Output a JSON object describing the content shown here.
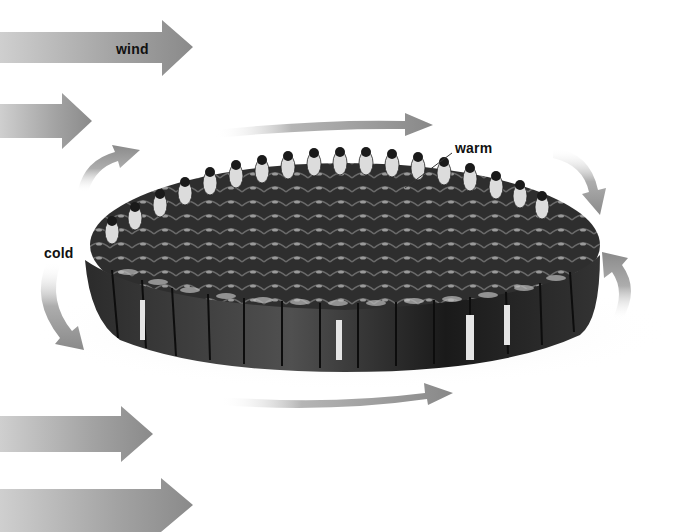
{
  "diagram": {
    "labels": {
      "wind": "wind",
      "warm": "warm",
      "cold": "cold"
    },
    "colors": {
      "arrow_gray": "#8c8c8c",
      "arrow_light": "#d9d9d9",
      "penguin_dark": "#1c1c1c",
      "penguin_mid": "#3a3a3a",
      "penguin_chest": "#e8e8e8",
      "ice": "#f1f1f1",
      "label_text": "#111111"
    },
    "elements": {
      "wind_arrows": [
        {
          "id": "wind-arrow-1",
          "y": 47,
          "tip_x": 193
        },
        {
          "id": "wind-arrow-2",
          "y": 121,
          "tip_x": 92
        },
        {
          "id": "wind-arrow-3",
          "y": 434,
          "tip_x": 153
        },
        {
          "id": "wind-arrow-4",
          "y": 505,
          "tip_x": 193
        }
      ],
      "circulation_arrows": [
        {
          "id": "top-arrow",
          "direction": "right"
        },
        {
          "id": "top-left-curve",
          "direction": "up-right"
        },
        {
          "id": "top-right-curve",
          "direction": "down"
        },
        {
          "id": "left-curve",
          "direction": "down-right"
        },
        {
          "id": "right-curve",
          "direction": "up"
        },
        {
          "id": "bottom-arrow",
          "direction": "right"
        }
      ]
    }
  }
}
